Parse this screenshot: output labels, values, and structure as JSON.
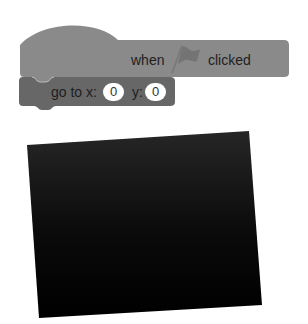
{
  "colors": {
    "hat_block": "#8a8a8a",
    "motion_block": "#676767",
    "block_text": "#1e1e1e",
    "input_bg": "#ffffff",
    "stage": "#0d0d0d"
  },
  "hat_block": {
    "label_before": "when",
    "icon": "green-flag-icon",
    "label_after": "clicked"
  },
  "motion_block": {
    "label": "go to x:",
    "x_value": "0",
    "y_label": "y:",
    "y_value": "0"
  },
  "stage": {
    "description": "black stage preview"
  }
}
